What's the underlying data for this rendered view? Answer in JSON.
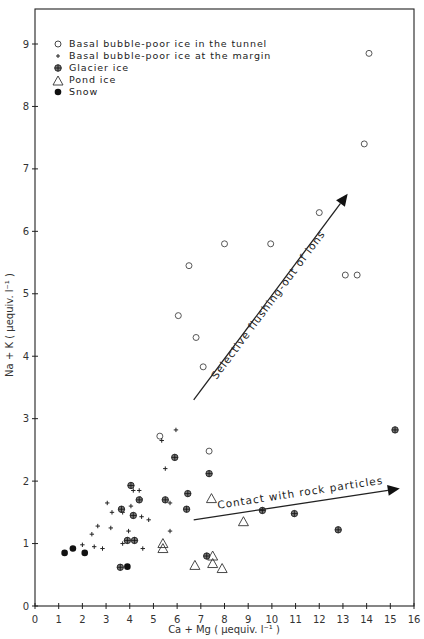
{
  "chart_data": {
    "type": "scatter",
    "title": "",
    "xlabel": "Ca + Mg ( μequiv. l⁻¹ )",
    "ylabel": "Na + K ( μequiv. l⁻¹ )",
    "xlim": [
      0,
      16
    ],
    "ylim": [
      0,
      9.3
    ],
    "xticks": [
      0,
      1,
      2,
      3,
      4,
      5,
      6,
      7,
      8,
      9,
      10,
      11,
      12,
      13,
      14,
      15,
      16
    ],
    "yticks": [
      0,
      1,
      2,
      3,
      4,
      5,
      6,
      7,
      8,
      9
    ],
    "grid": false,
    "legend_position": "upper left",
    "series": [
      {
        "name": "Basal bubble-poor ice in the tunnel",
        "marker": "open-circle",
        "points": [
          [
            14.1,
            8.85
          ],
          [
            13.9,
            7.4
          ],
          [
            12.0,
            6.3
          ],
          [
            9.95,
            5.8
          ],
          [
            8.0,
            5.8
          ],
          [
            6.5,
            5.45
          ],
          [
            6.05,
            4.65
          ],
          [
            6.8,
            4.3
          ],
          [
            7.1,
            3.83
          ],
          [
            13.1,
            5.3
          ],
          [
            13.6,
            5.3
          ],
          [
            5.27,
            2.72
          ],
          [
            7.35,
            2.48
          ]
        ]
      },
      {
        "name": "Basal bubble-poor ice at the margin",
        "marker": "plus",
        "points": [
          [
            5.95,
            2.82
          ],
          [
            5.35,
            2.65
          ],
          [
            5.5,
            2.2
          ],
          [
            4.15,
            1.85
          ],
          [
            4.4,
            1.85
          ],
          [
            4.45,
            1.72
          ],
          [
            3.05,
            1.65
          ],
          [
            3.25,
            1.5
          ],
          [
            3.7,
            1.5
          ],
          [
            5.7,
            1.65
          ],
          [
            4.05,
            1.6
          ],
          [
            4.5,
            1.43
          ],
          [
            4.8,
            1.38
          ],
          [
            2.65,
            1.28
          ],
          [
            3.2,
            1.25
          ],
          [
            3.95,
            1.2
          ],
          [
            4.2,
            1.07
          ],
          [
            2.4,
            1.15
          ],
          [
            2.0,
            0.98
          ],
          [
            2.5,
            0.95
          ],
          [
            2.85,
            0.92
          ],
          [
            5.7,
            1.2
          ],
          [
            3.7,
            1.0
          ],
          [
            4.55,
            0.92
          ]
        ]
      },
      {
        "name": "Glacier ice",
        "marker": "crossed-circle",
        "points": [
          [
            15.2,
            2.82
          ],
          [
            5.9,
            2.38
          ],
          [
            7.35,
            2.12
          ],
          [
            4.05,
            1.93
          ],
          [
            6.45,
            1.8
          ],
          [
            4.15,
            1.45
          ],
          [
            5.5,
            1.7
          ],
          [
            4.4,
            1.7
          ],
          [
            6.4,
            1.55
          ],
          [
            3.65,
            1.55
          ],
          [
            9.6,
            1.53
          ],
          [
            10.95,
            1.48
          ],
          [
            3.9,
            1.05
          ],
          [
            4.2,
            1.05
          ],
          [
            12.8,
            1.22
          ],
          [
            7.25,
            0.8
          ],
          [
            3.6,
            0.62
          ]
        ]
      },
      {
        "name": "Pond ice",
        "marker": "open-triangle",
        "points": [
          [
            7.45,
            1.72
          ],
          [
            8.8,
            1.35
          ],
          [
            5.4,
            1.0
          ],
          [
            5.4,
            0.92
          ],
          [
            7.5,
            0.8
          ],
          [
            6.75,
            0.65
          ],
          [
            7.5,
            0.68
          ],
          [
            7.9,
            0.6
          ]
        ]
      },
      {
        "name": "Snow",
        "marker": "filled-circle",
        "points": [
          [
            1.25,
            0.85
          ],
          [
            1.6,
            0.92
          ],
          [
            2.1,
            0.85
          ],
          [
            3.9,
            0.63
          ]
        ]
      }
    ],
    "annotations": [
      {
        "text": "Selective flushing-out of ions",
        "arrow_from": [
          6.7,
          3.3
        ],
        "arrow_to": [
          13.2,
          6.6
        ]
      },
      {
        "text": "Contact with rock particles",
        "arrow_from": [
          6.7,
          1.38
        ],
        "arrow_to": [
          15.4,
          1.88
        ]
      }
    ]
  },
  "legend": {
    "items": [
      {
        "label": "Basal bubble-poor ice in the tunnel"
      },
      {
        "label": "Basal bubble-poor ice at the margin"
      },
      {
        "label": "Glacier ice"
      },
      {
        "label": "Pond ice"
      },
      {
        "label": "Snow"
      }
    ]
  },
  "axes": {
    "x_label": "Ca + Mg ( μequiv. l⁻¹ )",
    "y_label": "Na + K ( μequiv. l⁻¹ )"
  },
  "annotations": {
    "flushing": "Selective flushing-out of ions",
    "contact": "Contact with rock particles"
  }
}
